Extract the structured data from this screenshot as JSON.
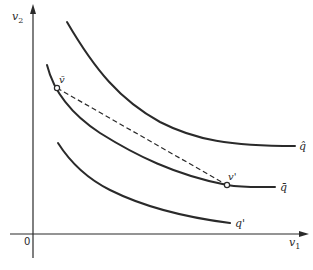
{
  "diagram": {
    "type": "indifference-curves",
    "axes": {
      "x_label": "v",
      "x_sub": "1",
      "y_label": "v",
      "y_sub": "2",
      "origin_label": "0"
    },
    "curves": [
      {
        "id": "q-hat",
        "label": "q̂"
      },
      {
        "id": "q-bar",
        "label": "q̄"
      },
      {
        "id": "q-prime",
        "label": "q'"
      }
    ],
    "points": [
      {
        "id": "v-bar",
        "label": "v̄"
      },
      {
        "id": "v-prime",
        "label": "v'"
      }
    ],
    "segment": {
      "from": "v-bar",
      "to": "v-prime",
      "style": "dashed"
    },
    "colors": {
      "ink": "#2a2a2a",
      "background": "#ffffff"
    }
  }
}
